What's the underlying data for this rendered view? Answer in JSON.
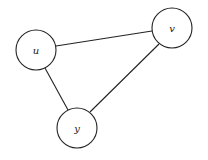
{
  "diagram": {
    "type": "undirected-graph",
    "nodes": [
      {
        "id": "u",
        "label": "u",
        "cx": 36,
        "cy": 50,
        "r": 20
      },
      {
        "id": "v",
        "label": "v",
        "cx": 172,
        "cy": 28,
        "r": 20
      },
      {
        "id": "y",
        "label": "y",
        "cx": 77,
        "cy": 128,
        "r": 20
      }
    ],
    "edges": [
      {
        "from": "u",
        "to": "v"
      },
      {
        "from": "u",
        "to": "y"
      },
      {
        "from": "v",
        "to": "y"
      }
    ],
    "colors": {
      "stroke": "#222222",
      "fill": "#ffffff"
    }
  }
}
